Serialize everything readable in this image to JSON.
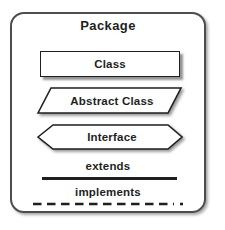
{
  "colors": {
    "line": "#1f1f1f",
    "shape_fill": "#ffffff",
    "shadow": "#8f8f8f",
    "background": "#ffffff"
  },
  "package": {
    "title": "Package",
    "legend": [
      {
        "shape": "rectangle",
        "label": "Class"
      },
      {
        "shape": "parallelogram",
        "label": "Abstract Class"
      },
      {
        "shape": "hexagon",
        "label": "Interface"
      },
      {
        "shape": "solid-line",
        "label": "extends"
      },
      {
        "shape": "dashed-line",
        "label": "implements"
      }
    ]
  }
}
